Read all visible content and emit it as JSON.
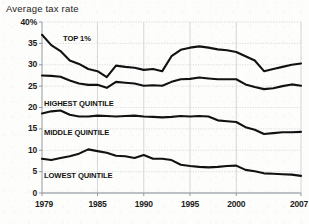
{
  "chart_data": {
    "type": "line",
    "title": "Average tax rate",
    "xlabel": "",
    "ylabel": "",
    "ylim": [
      0,
      40
    ],
    "xlim": [
      1979,
      2007
    ],
    "grid": true,
    "legend_position": "inline-labels",
    "ytick_labels": [
      "40%",
      "35",
      "30",
      "25",
      "20",
      "15",
      "10",
      "5",
      "0"
    ],
    "ytick_values": [
      40,
      35,
      30,
      25,
      20,
      15,
      10,
      5,
      0
    ],
    "xtick_labels": [
      "1979",
      "1985",
      "1990",
      "1995",
      "2000",
      "2007"
    ],
    "xtick_values": [
      1979,
      1985,
      1990,
      1995,
      2000,
      2007
    ],
    "x": [
      1979,
      1980,
      1981,
      1982,
      1983,
      1984,
      1985,
      1986,
      1987,
      1988,
      1989,
      1990,
      1991,
      1992,
      1993,
      1994,
      1995,
      1996,
      1997,
      1998,
      1999,
      2000,
      2001,
      2002,
      2003,
      2004,
      2005,
      2006,
      2007
    ],
    "series": [
      {
        "name": "TOP 1%",
        "label": "TOP 1%",
        "color": "#111111",
        "values": [
          37.0,
          34.6,
          33.2,
          31.0,
          30.2,
          29.0,
          28.5,
          27.1,
          29.8,
          29.5,
          29.3,
          28.8,
          29.0,
          28.5,
          32.0,
          33.5,
          34.0,
          34.3,
          34.0,
          33.6,
          33.4,
          33.0,
          32.0,
          31.0,
          28.5,
          29.0,
          29.5,
          30.0,
          30.3
        ],
        "note_start": "37.0 in 1979",
        "note_end": "30.3 in 2007"
      },
      {
        "name": "HIGHEST QUINTILE",
        "label": "HIGHEST QUINTILE",
        "color": "#111111",
        "values": [
          27.5,
          27.4,
          27.2,
          26.3,
          25.6,
          25.3,
          25.3,
          24.6,
          26.0,
          25.8,
          25.6,
          25.1,
          25.2,
          25.1,
          26.0,
          26.6,
          26.7,
          27.0,
          26.8,
          26.6,
          26.6,
          26.6,
          25.4,
          24.8,
          24.3,
          24.5,
          25.0,
          25.4,
          25.1
        ],
        "note_start": "27.5 in 1979",
        "note_end": "25.1 in 2007"
      },
      {
        "name": "MIDDLE QUINTILE",
        "label": "MIDDLE QUINTILE",
        "color": "#111111",
        "values": [
          18.6,
          19.1,
          19.3,
          18.3,
          17.9,
          17.9,
          18.1,
          18.0,
          17.9,
          18.0,
          18.1,
          17.9,
          17.8,
          17.7,
          17.8,
          18.0,
          17.9,
          18.0,
          17.9,
          17.0,
          16.8,
          16.6,
          15.4,
          14.8,
          13.8,
          14.0,
          14.2,
          14.2,
          14.3
        ],
        "note_start": "18.6 in 1979",
        "note_end": "14.3 in 2007"
      },
      {
        "name": "LOWEST QUINTILE",
        "label": "LOWEST QUINTILE",
        "color": "#111111",
        "values": [
          8.0,
          7.7,
          8.2,
          8.6,
          9.2,
          10.2,
          9.8,
          9.4,
          8.7,
          8.6,
          8.2,
          8.9,
          8.0,
          8.0,
          7.7,
          6.6,
          6.3,
          6.1,
          6.0,
          6.1,
          6.3,
          6.4,
          5.4,
          5.1,
          4.6,
          4.5,
          4.4,
          4.3,
          4.0
        ],
        "note_start": "8.0 in 1979",
        "note_end": "4.0 in 2007"
      }
    ]
  },
  "labels": {
    "top1": "TOP 1%",
    "highest": "HIGHEST QUINTILE",
    "middle": "MIDDLE QUINTILE",
    "lowest": "LOWEST QUINTILE"
  },
  "title": "Average tax rate",
  "colors": {
    "line": "#111111",
    "grid": "#c8cfd6",
    "axis": "#8a9098",
    "background": "#fdfdfb",
    "text": "#1c1c1c"
  }
}
